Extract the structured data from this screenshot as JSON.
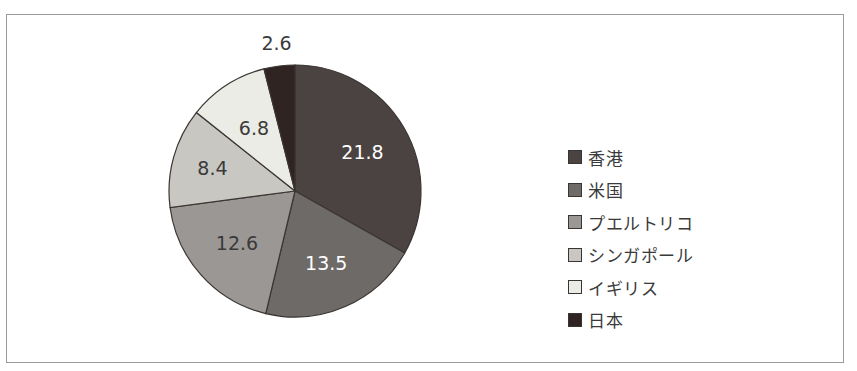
{
  "chart_data": {
    "type": "pie",
    "title": "",
    "categories": [
      "香港",
      "米国",
      "プエルトリコ",
      "シンガポール",
      "イギリス",
      "日本"
    ],
    "values": [
      21.8,
      13.5,
      12.6,
      8.4,
      6.8,
      2.6
    ],
    "colors": [
      "#4a4341",
      "#6e6a67",
      "#9a9794",
      "#c8c7c2",
      "#ecece6",
      "#2f2421"
    ],
    "label_colors": [
      "#ffffff",
      "#ffffff",
      "#3a3a3a",
      "#3a3a3a",
      "#3a3a3a",
      "#3a3a3a"
    ],
    "data_labels": [
      "21.8",
      "13.5",
      "12.6",
      "8.4",
      "6.8",
      "2.6"
    ],
    "start_angle_deg": 0,
    "direction": "clockwise",
    "legend_position": "right"
  },
  "legend": {
    "items": [
      {
        "label": "香港"
      },
      {
        "label": "米国"
      },
      {
        "label": "プエルトリコ"
      },
      {
        "label": "シンガポール"
      },
      {
        "label": "イギリス"
      },
      {
        "label": "日本"
      }
    ]
  }
}
